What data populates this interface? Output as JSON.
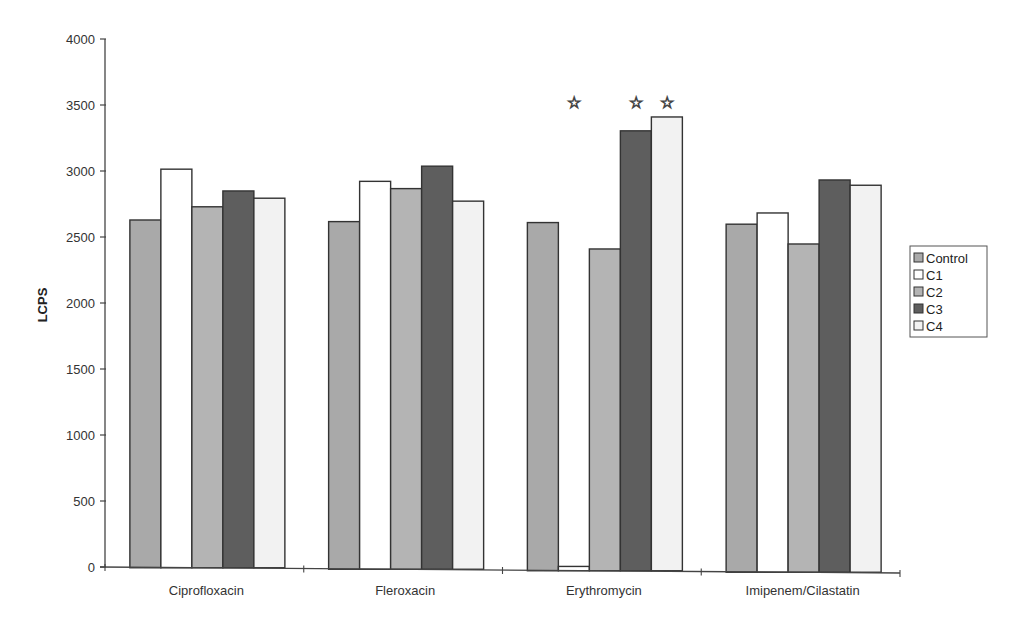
{
  "chart_data": {
    "type": "bar",
    "title": "",
    "xlabel": "",
    "ylabel": "LCPS",
    "ylim": [
      0,
      4000
    ],
    "yticks": [
      0,
      500,
      1000,
      1500,
      2000,
      2500,
      3000,
      3500,
      4000
    ],
    "grid": false,
    "legend_position": "right",
    "categories": [
      "Ciprofloxacin",
      "Fleroxacin",
      "Erythromycin",
      "Imipenem/Cilastatin"
    ],
    "series": [
      {
        "name": "Control",
        "color": "#a9a9a9",
        "values": [
          2630,
          2620,
          2615,
          2605
        ]
      },
      {
        "name": "C1",
        "color": "#ffffff",
        "values": [
          3015,
          2925,
          10,
          2690
        ]
      },
      {
        "name": "C2",
        "color": "#b4b4b4",
        "values": [
          2730,
          2870,
          2415,
          2455
        ]
      },
      {
        "name": "C3",
        "color": "#5e5e5e",
        "values": [
          2850,
          3040,
          3310,
          2940
        ]
      },
      {
        "name": "C4",
        "color": "#f2f2f2",
        "values": [
          2795,
          2775,
          3415,
          2900
        ]
      }
    ],
    "annotations": [
      {
        "category": "Erythromycin",
        "series": "C1",
        "symbol": "☆",
        "meaning": "significant"
      },
      {
        "category": "Erythromycin",
        "series": "C3",
        "symbol": "☆",
        "meaning": "significant"
      },
      {
        "category": "Erythromycin",
        "series": "C4",
        "symbol": "☆",
        "meaning": "significant"
      }
    ],
    "annotation_y": 3520
  }
}
